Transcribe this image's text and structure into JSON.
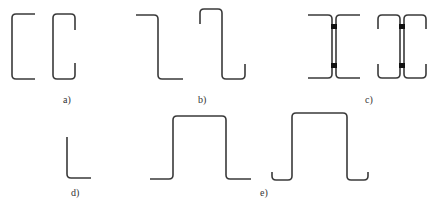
{
  "figure": {
    "panels": [
      {
        "id": "a",
        "label": "a)",
        "description": "Plain channel and lipped channel sections"
      },
      {
        "id": "b",
        "label": "b)",
        "description": "Plain Z and lipped Z sections"
      },
      {
        "id": "c",
        "label": "c)",
        "description": "Built-up I-sections from back-to-back channels with welds"
      },
      {
        "id": "d",
        "label": "d)",
        "description": "Angle section"
      },
      {
        "id": "e",
        "label": "e)",
        "description": "Hat (omega) sections, plain and lipped"
      }
    ]
  },
  "style": {
    "stroke_color": "#3a3a3a",
    "weld_color": "#111111",
    "background": "#ffffff"
  }
}
